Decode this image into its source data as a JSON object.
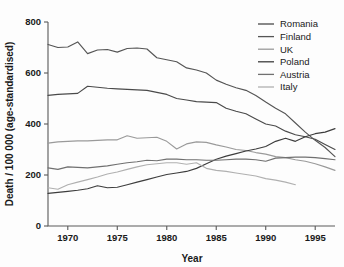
{
  "chart_data": {
    "type": "line",
    "title": "",
    "xlabel": "Year",
    "ylabel": "Death / 100 000 (age-standardised)",
    "xlim": [
      1968,
      1997
    ],
    "ylim": [
      0,
      800
    ],
    "xticks": [
      1970,
      1975,
      1980,
      1985,
      1990,
      1995
    ],
    "yticks": [
      0,
      200,
      400,
      600,
      800
    ],
    "grid": false,
    "legend_position": "top-right",
    "series": [
      {
        "name": "Romania",
        "color": "#4a4a4a",
        "x": [
          1968,
          1969,
          1970,
          1971,
          1972,
          1973,
          1974,
          1975,
          1976,
          1977,
          1978,
          1979,
          1980,
          1981,
          1982,
          1983,
          1984,
          1985,
          1986,
          1987,
          1988,
          1989,
          1990,
          1991,
          1992,
          1993,
          1994,
          1995,
          1996,
          1997
        ],
        "values": [
          512,
          516,
          518,
          520,
          548,
          544,
          540,
          538,
          536,
          534,
          532,
          524,
          516,
          500,
          494,
          488,
          486,
          484,
          462,
          450,
          440,
          420,
          400,
          392,
          372,
          358,
          350,
          340,
          320,
          300
        ]
      },
      {
        "name": "Finland",
        "color": "#555555",
        "x": [
          1968,
          1969,
          1970,
          1971,
          1972,
          1973,
          1974,
          1975,
          1976,
          1977,
          1978,
          1979,
          1980,
          1981,
          1982,
          1983,
          1984,
          1985,
          1986,
          1987,
          1988,
          1989,
          1990,
          1991,
          1992,
          1993,
          1994,
          1995,
          1996,
          1997
        ],
        "values": [
          712,
          700,
          702,
          722,
          676,
          690,
          692,
          682,
          696,
          698,
          694,
          660,
          652,
          644,
          620,
          612,
          600,
          572,
          556,
          542,
          532,
          512,
          486,
          462,
          440,
          404,
          368,
          336,
          308,
          272
        ]
      },
      {
        "name": "UK",
        "color": "#9a9a9a",
        "x": [
          1968,
          1969,
          1970,
          1971,
          1972,
          1973,
          1974,
          1975,
          1976,
          1977,
          1978,
          1979,
          1980,
          1981,
          1982,
          1983,
          1984,
          1985,
          1986,
          1987,
          1988,
          1989,
          1990,
          1991,
          1992,
          1993,
          1994,
          1995,
          1996,
          1997
        ],
        "values": [
          325,
          330,
          332,
          334,
          334,
          336,
          338,
          338,
          354,
          344,
          346,
          348,
          332,
          302,
          322,
          330,
          328,
          318,
          310,
          300,
          296,
          288,
          282,
          272,
          268,
          260,
          254,
          244,
          232,
          218
        ]
      },
      {
        "name": "Poland",
        "color": "#3d3d3d",
        "x": [
          1968,
          1969,
          1970,
          1971,
          1972,
          1973,
          1974,
          1975,
          1976,
          1977,
          1978,
          1979,
          1980,
          1981,
          1982,
          1983,
          1984,
          1985,
          1986,
          1987,
          1988,
          1989,
          1990,
          1991,
          1992,
          1993,
          1994,
          1995,
          1996,
          1997
        ],
        "values": [
          128,
          132,
          136,
          140,
          146,
          158,
          150,
          152,
          162,
          172,
          182,
          192,
          202,
          208,
          214,
          226,
          244,
          262,
          274,
          284,
          294,
          302,
          312,
          332,
          344,
          332,
          350,
          362,
          368,
          382
        ]
      },
      {
        "name": "Austria",
        "color": "#707070",
        "x": [
          1968,
          1969,
          1970,
          1971,
          1972,
          1973,
          1974,
          1975,
          1976,
          1977,
          1978,
          1979,
          1980,
          1981,
          1982,
          1983,
          1984,
          1985,
          1986,
          1987,
          1988,
          1989,
          1990,
          1991,
          1992,
          1993,
          1994,
          1995,
          1996,
          1997
        ],
        "values": [
          228,
          222,
          232,
          230,
          228,
          232,
          236,
          242,
          248,
          252,
          258,
          256,
          262,
          262,
          260,
          260,
          258,
          258,
          260,
          262,
          262,
          260,
          254,
          266,
          268,
          270,
          270,
          268,
          264,
          260
        ]
      },
      {
        "name": "Italy",
        "color": "#b0b0b0",
        "x": [
          1968,
          1969,
          1970,
          1971,
          1972,
          1973,
          1974,
          1975,
          1976,
          1977,
          1978,
          1979,
          1980,
          1981,
          1982,
          1983,
          1984,
          1985,
          1986,
          1987,
          1988,
          1989,
          1990,
          1991,
          1992,
          1993
        ],
        "values": [
          150,
          144,
          162,
          172,
          182,
          192,
          204,
          212,
          222,
          232,
          240,
          244,
          248,
          248,
          242,
          248,
          226,
          218,
          214,
          208,
          202,
          196,
          186,
          180,
          172,
          162
        ]
      }
    ]
  },
  "legend": {
    "items": [
      {
        "label": "Romania"
      },
      {
        "label": "Finland"
      },
      {
        "label": "UK"
      },
      {
        "label": "Poland"
      },
      {
        "label": "Austria"
      },
      {
        "label": "Italy"
      }
    ]
  },
  "axes": {
    "y_title": "Death / 100 000 (age-standardised)",
    "x_title": "Year",
    "y_tick_labels": [
      "0",
      "200",
      "400",
      "600",
      "800"
    ],
    "x_tick_labels": [
      "1970",
      "1975",
      "1980",
      "1985",
      "1990",
      "1995"
    ]
  }
}
